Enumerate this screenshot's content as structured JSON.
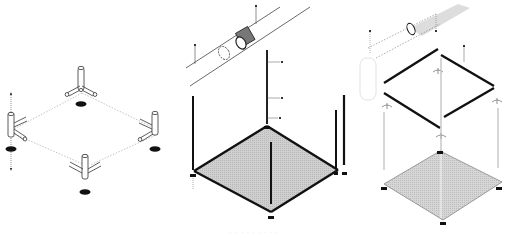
{
  "figure": {
    "type": "isometric exploded assembly diagram",
    "colors": {
      "background": "#ffffff",
      "line": "#222222",
      "thin_line": "#999999",
      "mesh_fill": "#c8c8c8",
      "foot_fill": "#111111"
    },
    "panels": [
      {
        "id": "panel-1",
        "description": "Base frame: four corner connectors with leveling feet, dashed outline of square frame",
        "parts": [
          "corner-connector",
          "leveling-foot",
          "dashed-frame-outline",
          "assembly-arrow"
        ]
      },
      {
        "id": "panel-2",
        "description": "Pipe sleeve joint detail, vertical posts with labels, mesh floor platform with thick frame rails",
        "parts": [
          "pipe-sleeve-detail",
          "vertical-post",
          "mesh-floor",
          "frame-rail",
          "label-ticks"
        ]
      },
      {
        "id": "panel-3",
        "description": "Full assembly: top frame, posts, corner brackets, mesh floor, pipe joint detail",
        "parts": [
          "pipe-joint-detail",
          "top-frame",
          "corner-bracket",
          "vertical-post",
          "mesh-floor",
          "side-panel-outline"
        ]
      }
    ],
    "caption": "· · ·  · · · · · ·"
  }
}
